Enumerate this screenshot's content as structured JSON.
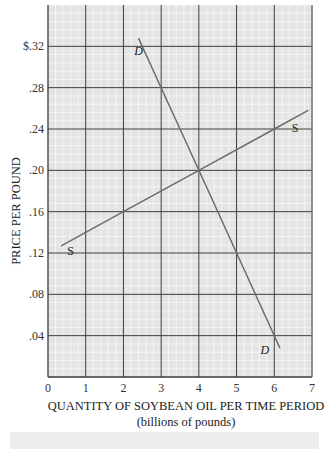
{
  "chart_data": {
    "type": "line",
    "title": "",
    "xlabel": "QUANTITY OF SOYBEAN OIL PER TIME PERIOD",
    "xlabel_sub": "(billions of pounds)",
    "ylabel": "PRICE PER POUND",
    "xlim": [
      0,
      7
    ],
    "ylim": [
      0,
      0.36
    ],
    "x_ticks": [
      0,
      1,
      2,
      3,
      4,
      5,
      6,
      7
    ],
    "x_tick_labels": [
      "0",
      "1",
      "2",
      "3",
      "4",
      "5",
      "6",
      "7"
    ],
    "y_ticks": [
      0.04,
      0.08,
      0.12,
      0.16,
      0.2,
      0.24,
      0.28,
      0.32
    ],
    "y_tick_labels": [
      ".04",
      ".08",
      ".12",
      ".16",
      ".20",
      ".24",
      ".28",
      "$.32"
    ],
    "grid": true,
    "minor_grid_per_unit_x": 5,
    "minor_grid_per_unit_y": 5,
    "series": [
      {
        "name": "Demand",
        "label": "D",
        "label_italic": true,
        "color": "#6b6b6b",
        "points": [
          [
            2.4,
            0.328
          ],
          [
            3,
            0.28
          ],
          [
            4,
            0.2
          ],
          [
            5,
            0.12
          ],
          [
            6,
            0.04
          ],
          [
            6.15,
            0.028
          ]
        ],
        "label_positions": [
          [
            2.4,
            0.312
          ],
          [
            5.75,
            0.022
          ]
        ]
      },
      {
        "name": "Supply",
        "label": "S",
        "label_italic": false,
        "color": "#6b6b6b",
        "points": [
          [
            0.35,
            0.127
          ],
          [
            2,
            0.16
          ],
          [
            4,
            0.2
          ],
          [
            6,
            0.24
          ],
          [
            6.9,
            0.258
          ]
        ],
        "label_positions": [
          [
            0.6,
            0.118
          ],
          [
            6.55,
            0.237
          ]
        ]
      }
    ],
    "equilibrium": {
      "quantity": 4,
      "price": 0.2
    }
  },
  "colors": {
    "background": "#e4e4e4",
    "minor_grid": "#f4f4f4",
    "major_grid": "#3a3a3a",
    "curve": "#6b6b6b"
  }
}
